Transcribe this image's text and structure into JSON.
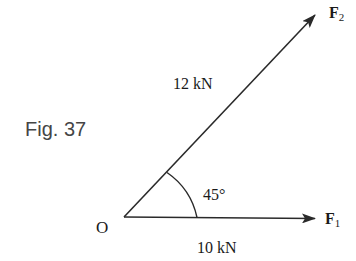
{
  "figure": {
    "caption": "Fig. 37",
    "origin_label": "O",
    "angle_label": "45°",
    "colors": {
      "line": "#2a2a2a",
      "text": "#1a1a1a",
      "caption": "#454545"
    }
  },
  "vectors": [
    {
      "name": "F",
      "subscript": "1",
      "magnitude_label": "10 kN",
      "angle_deg": 0
    },
    {
      "name": "F",
      "subscript": "2",
      "magnitude_label": "12 kN",
      "angle_deg": 45
    }
  ]
}
